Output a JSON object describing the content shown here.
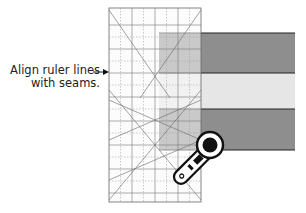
{
  "diagram": {
    "callout": {
      "line1": "Align ruler lines",
      "line2": "with seams."
    },
    "ruler": {
      "x": 109,
      "y": 8,
      "width": 92,
      "height": 194,
      "grid_spacing": 24,
      "color": "#f8f8f8",
      "line_color": "#555555"
    },
    "fabric_strips": [
      {
        "name": "dark-strip-top",
        "y": 33,
        "height": 40,
        "color": "#8e8e8e"
      },
      {
        "name": "light-strip-middle",
        "y": 73,
        "height": 36,
        "color": "#e6e6e6"
      },
      {
        "name": "dark-strip-bottom",
        "y": 109,
        "height": 41,
        "color": "#8e8e8e"
      }
    ],
    "fabric": {
      "x": 159,
      "width": 136
    },
    "rotary_cutter": {
      "icon": "rotary-cutter-icon"
    },
    "arrow": {
      "icon": "arrow-right-icon"
    }
  }
}
